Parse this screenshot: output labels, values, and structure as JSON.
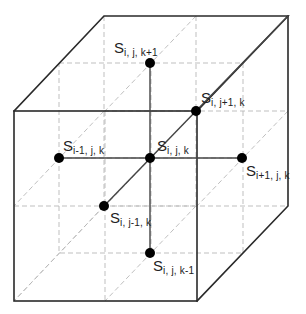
{
  "diagram": {
    "type": "3d-grid-stencil",
    "colors": {
      "edge": "#2a2a2a",
      "grid": "#b8b8b8",
      "node": "#000000",
      "connector": "#444444"
    },
    "nodes": [
      {
        "id": "center",
        "symbol": "S",
        "subscript": "i, j, k",
        "x": 150,
        "y": 158
      },
      {
        "id": "i-minus",
        "symbol": "S",
        "subscript": "i-1, j, k",
        "x": 59,
        "y": 158
      },
      {
        "id": "i-plus",
        "symbol": "S",
        "subscript": "i+1, j, k",
        "x": 242,
        "y": 158
      },
      {
        "id": "j-minus",
        "symbol": "S",
        "subscript": "i, j-1, k",
        "x": 104,
        "y": 206
      },
      {
        "id": "j-plus",
        "symbol": "S",
        "subscript": "i, j+1, k",
        "x": 196,
        "y": 111
      },
      {
        "id": "k-plus",
        "symbol": "S",
        "subscript": "i, j, k+1",
        "x": 150,
        "y": 63
      },
      {
        "id": "k-minus",
        "symbol": "S",
        "subscript": "i, j, k-1",
        "x": 150,
        "y": 253
      }
    ]
  },
  "labels": {
    "center": {
      "symbol": "S",
      "sub": "i, j, k"
    },
    "i_minus": {
      "symbol": "S",
      "sub": "i-1, j, k"
    },
    "i_plus": {
      "symbol": "S",
      "sub": "i+1, j, k"
    },
    "j_minus": {
      "symbol": "S",
      "sub": "i, j-1, k"
    },
    "j_plus": {
      "symbol": "S",
      "sub": "i, j+1, k"
    },
    "k_plus": {
      "symbol": "S",
      "sub": "i, j, k+1"
    },
    "k_minus": {
      "symbol": "S",
      "sub": "i, j, k-1"
    }
  }
}
